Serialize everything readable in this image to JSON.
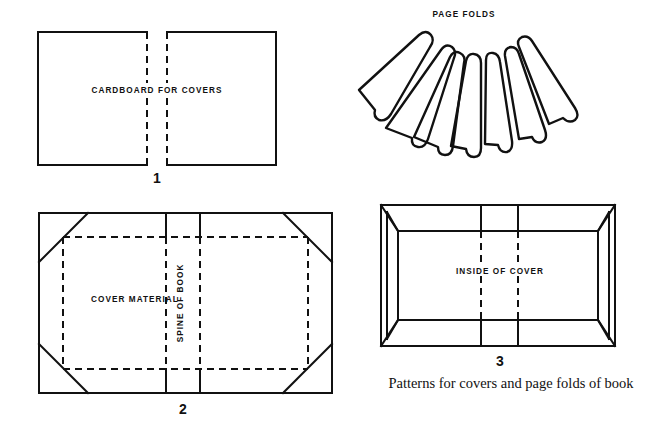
{
  "figure": {
    "caption": "Patterns for covers and page folds of book",
    "background_color": "#ffffff",
    "ink_color": "#111111"
  },
  "panels": [
    {
      "number": "1",
      "label": "CARDBOARD FOR COVERS",
      "name": "cardboard-for-covers",
      "description": "Two square cardboard cover boards side by side with dashed inner edges"
    },
    {
      "number": "2",
      "label": "COVER MATERIAL",
      "secondary_label": "SPINE OF BOOK",
      "name": "cover-material",
      "description": "Rectangle of cover material with mitered corners and dashed fold lines around a spine band"
    },
    {
      "number": "3",
      "label": "INSIDE OF COVER",
      "name": "inside-of-cover",
      "description": "Finished cover seen from inside with edges turned in and dashed spine lines"
    },
    {
      "number": "",
      "label": "PAGE FOLDS",
      "name": "page-folds",
      "description": "Seven elongated folded page signatures fanned out in an arc"
    }
  ]
}
